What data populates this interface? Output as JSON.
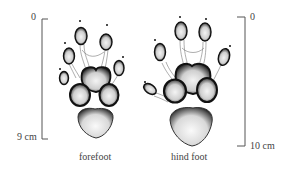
{
  "figure": {
    "feet": [
      {
        "name": "forefoot",
        "label": "forefoot",
        "scale_top": "0",
        "scale_bottom": "9 cm"
      },
      {
        "name": "hind foot",
        "label": "hind foot",
        "scale_top": "0",
        "scale_bottom": "10 cm"
      }
    ]
  }
}
